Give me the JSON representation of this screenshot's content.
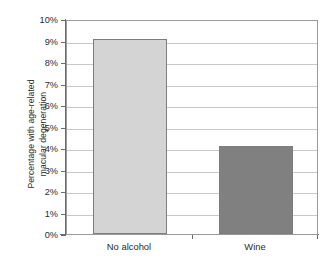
{
  "chart_data": {
    "type": "bar",
    "title": "",
    "subtitle": "",
    "xlabel": "",
    "ylabel": "Percentage with age-related macular degeneration",
    "ylabel_lines": [
      "Percentage with age-related",
      "macular degeneration"
    ],
    "categories": [
      "No alcohol",
      "Wine"
    ],
    "values": [
      9.05,
      4.1
    ],
    "value_unit": "%",
    "ylim": [
      0,
      10
    ],
    "ytick_values": [
      0,
      1,
      2,
      3,
      4,
      5,
      6,
      7,
      8,
      9,
      10
    ],
    "ytick_labels": [
      "0%",
      "1%",
      "2%",
      "3%",
      "4%",
      "5%",
      "6%",
      "7%",
      "8%",
      "9%",
      "10%"
    ],
    "grid": true,
    "grid_axis": "y",
    "legend": false,
    "legend_position": "none",
    "series": [
      {
        "name": "Percentage with age-related macular degeneration",
        "values": [
          9.05,
          4.1
        ]
      }
    ],
    "bar_colors": [
      "#d4d4d4",
      "#808080"
    ],
    "bar_border_color": "#7d7d7d",
    "gridline_color": "#c9c9c9",
    "axis_color": "#6b6b6b",
    "plot_border_color": "#9a9a9a",
    "background_color": "#ffffff",
    "text_color": "#2b2b2b"
  }
}
